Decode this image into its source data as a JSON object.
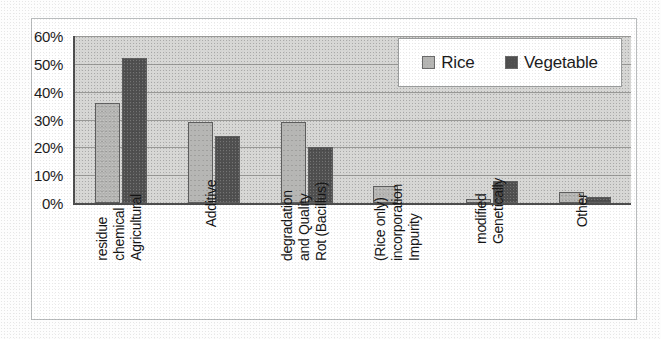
{
  "chart_data": {
    "type": "bar",
    "title": "",
    "subtitle": "",
    "xlabel": "",
    "ylabel": "",
    "ylim": [
      0,
      60
    ],
    "y_tick_labels": [
      "60%",
      "50%",
      "40%",
      "30%",
      "20%",
      "10%",
      "0%"
    ],
    "y_tick_values": [
      60,
      50,
      40,
      30,
      20,
      10,
      0
    ],
    "grid": true,
    "grid_axis": "y",
    "legend_position": "top-right",
    "categories": [
      "Agricultural chemical residue",
      "Additive",
      "Rot (Bacillus) and Quality degradation",
      "Impurity incorporation (Rice only)",
      "Genetically modified",
      "Other"
    ],
    "category_label_lines": [
      [
        "Agricultural",
        "chemical",
        "residue"
      ],
      [
        "Additive"
      ],
      [
        "Rot (Bacillus)",
        "and Quality",
        "degradation"
      ],
      [
        "Impurity",
        "incorporation",
        "(Rice only)"
      ],
      [
        "Genetically",
        "modified"
      ],
      [
        "Other"
      ]
    ],
    "series": [
      {
        "name": "Rice",
        "color": "#b6b6b4",
        "values": [
          36,
          29,
          29,
          6,
          1.5,
          4
        ]
      },
      {
        "name": "Vegetable",
        "color": "#4f4f4f",
        "values": [
          52,
          24,
          20,
          0,
          8,
          2
        ]
      }
    ],
    "value_unit": "%"
  },
  "legend": {
    "items": [
      {
        "label": "Rice",
        "color": "#b6b6b4"
      },
      {
        "label": "Vegetable",
        "color": "#4f4f4f"
      }
    ]
  },
  "colors": {
    "rice": "#b6b6b4",
    "vegetable": "#4f4f4f",
    "plot_background": "#d6d6d4",
    "axis": "#4c4c4c",
    "gridline": "#8d8d8b",
    "frame": "#b9bcbd",
    "text": "#141414"
  }
}
